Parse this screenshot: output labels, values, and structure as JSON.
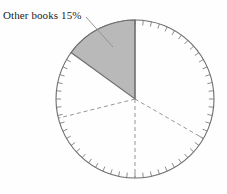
{
  "chart_data": {
    "type": "pie",
    "title": "",
    "subtitle": "",
    "xlabel": "",
    "ylabel": "",
    "legend_position": "none",
    "grid": false,
    "categories": [
      "Other books",
      "Segment 2",
      "Segment 3",
      "Segment 4",
      "Segment 5"
    ],
    "values": [
      15,
      25,
      25,
      20,
      15
    ],
    "labels": [
      "Other books 15%",
      "",
      "",
      "",
      ""
    ],
    "annotations": [
      "Other books 15%"
    ],
    "highlighted_slice": "Other books",
    "highlighted_value": 15,
    "highlighted_unit": "%",
    "start_angle_deg": 90,
    "direction": "counterclockwise",
    "slice_boundaries_deg": [
      90,
      144,
      194,
      270,
      330,
      450
    ],
    "colors": {
      "highlight_fill": "#b9b9b9",
      "outline": "#6e6e6e",
      "dashed_divider": "#8a8a8a",
      "background": "#fefefe",
      "label_text": "#1c1c1c"
    },
    "geometry": {
      "center_x": 135,
      "center_y": 99,
      "radius": 79,
      "tick_count": 60,
      "tick_length": 5
    }
  },
  "label": {
    "slice_label": "Other books 15%"
  },
  "icons": {
    "leader": "leader-line-icon"
  }
}
